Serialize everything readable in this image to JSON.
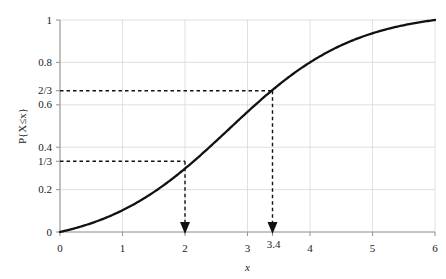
{
  "chart_data": {
    "type": "line",
    "title": "",
    "xlabel": "x",
    "ylabel": "P{X≤x}",
    "xlim": [
      0,
      6
    ],
    "ylim": [
      0,
      1
    ],
    "grid": true,
    "legend": null,
    "x_ticks": [
      {
        "value": 0,
        "label": "0"
      },
      {
        "value": 1,
        "label": "1"
      },
      {
        "value": 2,
        "label": "2"
      },
      {
        "value": 3,
        "label": "3"
      },
      {
        "value": 3.4,
        "label": "3.4"
      },
      {
        "value": 4,
        "label": "4"
      },
      {
        "value": 5,
        "label": "5"
      },
      {
        "value": 6,
        "label": "6"
      }
    ],
    "y_ticks": [
      {
        "value": 0,
        "label": "0"
      },
      {
        "value": 0.2,
        "label": "0.2"
      },
      {
        "value": 0.3333,
        "label": "1/3"
      },
      {
        "value": 0.4,
        "label": "0.4"
      },
      {
        "value": 0.6,
        "label": "0.6"
      },
      {
        "value": 0.6667,
        "label": "2/3"
      },
      {
        "value": 0.8,
        "label": "0.8"
      },
      {
        "value": 1,
        "label": "1"
      }
    ],
    "series": [
      {
        "name": "cdf",
        "color": "#111111",
        "x": [
          0.0,
          0.2,
          0.4,
          0.6,
          0.8,
          1.0,
          1.2,
          1.4,
          1.6,
          1.8,
          2.0,
          2.2,
          2.4,
          2.6,
          2.8,
          3.0,
          3.2,
          3.4,
          3.6,
          3.8,
          4.0,
          4.2,
          4.4,
          4.6,
          4.8,
          5.0,
          5.2,
          5.4,
          5.6,
          5.8,
          6.0
        ],
        "y": [
          0.004,
          0.007,
          0.012,
          0.021,
          0.036,
          0.06,
          0.097,
          0.15,
          0.22,
          0.3,
          0.333,
          0.42,
          0.49,
          0.555,
          0.615,
          0.665,
          0.7,
          0.667,
          0.83,
          0.87,
          0.905,
          0.932,
          0.952,
          0.967,
          0.978,
          0.985,
          0.99,
          0.994,
          0.997,
          0.999,
          1.0
        ]
      }
    ],
    "annotations": [
      {
        "name": "lower-quartile-guide",
        "x": 2,
        "y": 0.3333,
        "x_label": "2",
        "y_label": "1/3",
        "style": "dashed-with-arrow"
      },
      {
        "name": "upper-quartile-guide",
        "x": 3.4,
        "y": 0.6667,
        "x_label": "3.4",
        "y_label": "2/3",
        "style": "dashed-with-arrow"
      }
    ]
  },
  "axes": {
    "x_axis_title": "x",
    "y_axis_title": "P{X≤x}"
  }
}
